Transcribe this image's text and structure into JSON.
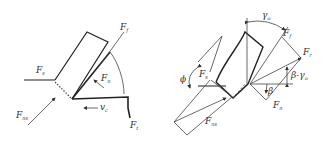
{
  "figure": {
    "left_panel": {
      "labels": {
        "F_f": {
          "main": "F",
          "sub": "f"
        },
        "F_s": {
          "main": "F",
          "sub": "s"
        },
        "F_n": {
          "main": "F",
          "sub": "n"
        },
        "F_ns": {
          "main": "F",
          "sub": "ns"
        },
        "v_c": {
          "main": "v",
          "sub": "c"
        },
        "F_t": {
          "main": "F",
          "sub": "t"
        }
      }
    },
    "right_panel": {
      "labels": {
        "gamma_o": {
          "main": "γ",
          "sub": "o"
        },
        "F_f": {
          "main": "F",
          "sub": "f"
        },
        "F_r": {
          "main": "F",
          "sub": "r"
        },
        "beta_minus_gamma": {
          "main": "β-γ",
          "sub": "o"
        },
        "beta": {
          "main": "β",
          "sub": ""
        },
        "F_n": {
          "main": "F",
          "sub": "n"
        },
        "F_s": {
          "main": "F",
          "sub": "s"
        },
        "phi": {
          "main": "ϕ",
          "sub": ""
        },
        "F_ns": {
          "main": "F",
          "sub": "ns"
        }
      }
    }
  }
}
